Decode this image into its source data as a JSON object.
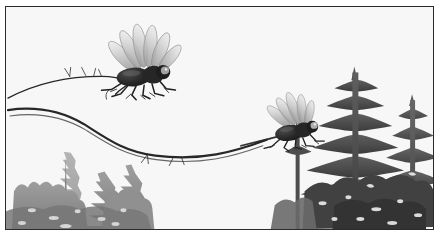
{
  "image": {
    "title": "Two flies over a conifer treeline",
    "medium": "grayscale ink and wash illustration",
    "background_color": "#ffffff",
    "frame": {
      "border_color": "#2b2b2b",
      "border_width_px": 1.6,
      "inset_left_px": 5,
      "inset_top_px": 6,
      "width_px": 429,
      "height_px": 224
    },
    "palette": {
      "ink_black": "#1c1c1c",
      "body_dark": "#2a2a2a",
      "wing_gray": "#b8b8b8",
      "wing_light": "#d8d8d8",
      "tree_far_gray": "#a9a9a9",
      "tree_mid_gray": "#8c8c8c",
      "tree_near_dark": "#4f4f4f",
      "branch_ink": "#232323",
      "paper_white": "#fefefe"
    },
    "subjects": [
      {
        "name": "large-fly",
        "description": "large fly perched on branch with fan of translucent wings spread upward",
        "center_x_px": 143,
        "center_y_px": 73,
        "body_length_px": 48,
        "wing_count": 6
      },
      {
        "name": "small-fly",
        "description": "smaller fly in flight with wings swept up and back, eye highlighted",
        "center_x_px": 293,
        "center_y_px": 127,
        "body_length_px": 36,
        "wing_count": 5
      }
    ],
    "branches": [
      {
        "name": "upper-branch",
        "description": "thin curved twig entering from left edge, arcing right toward the large fly"
      },
      {
        "name": "lower-branch",
        "description": "long sagging branch that dips through mid-frame and rises to the small fly"
      },
      {
        "name": "flight-trail",
        "description": "thin dark streak trailing left from the small fly"
      }
    ],
    "treeline": {
      "description": "silhouetted spruce and fir trees along the lower frame; pale distant cluster at left, tall dark spruces at right",
      "left_cluster_width_px": 145,
      "right_cluster_width_px": 150,
      "center_gap": "open white fog between the two clusters"
    }
  }
}
